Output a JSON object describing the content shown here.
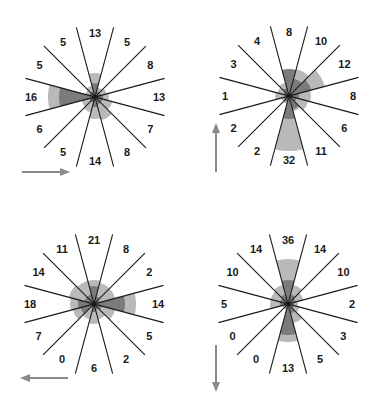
{
  "colors": {
    "background": "#ffffff",
    "line": "#1a1a1a",
    "wedge_light": "#b9b9b9",
    "wedge_dark": "#7b7b7b",
    "arrow": "#8a8a8a",
    "label": "#1a1a1a"
  },
  "layout": {
    "line_half_length": 72,
    "label_radius": 64,
    "sector_angles_deg": [
      0,
      30,
      60,
      90,
      120,
      150,
      180,
      210,
      240,
      270,
      300,
      330
    ],
    "boundary_angles_deg": [
      15,
      45,
      75,
      105,
      135,
      165
    ]
  },
  "panels": [
    {
      "id": "panel-1",
      "center": [
        95,
        97
      ],
      "direction": "right",
      "arrow": {
        "x1": 22,
        "y1": 172,
        "x2": 70,
        "y2": 172
      },
      "labels": [
        "13",
        "5",
        "8",
        "13",
        "7",
        "8",
        "14",
        "5",
        "6",
        "16",
        "5",
        "5"
      ],
      "light_radii": [
        24,
        10,
        12,
        14,
        18,
        24,
        22,
        16,
        14,
        47,
        10,
        12
      ],
      "dark_radii": [
        14,
        6,
        6,
        8,
        8,
        8,
        10,
        6,
        6,
        36,
        6,
        6
      ]
    },
    {
      "id": "panel-2",
      "center": [
        289,
        96
      ],
      "direction": "up",
      "arrow": {
        "x1": 216,
        "y1": 172,
        "x2": 216,
        "y2": 123
      },
      "labels": [
        "8",
        "10",
        "12",
        "8",
        "6",
        "11",
        "32",
        "2",
        "2",
        "1",
        "3",
        "4"
      ],
      "light_radii": [
        26,
        28,
        37,
        22,
        20,
        16,
        55,
        8,
        8,
        14,
        12,
        14
      ],
      "dark_radii": [
        27,
        18,
        23,
        10,
        8,
        14,
        23,
        6,
        6,
        4,
        6,
        8
      ]
    },
    {
      "id": "panel-3",
      "center": [
        94,
        304
      ],
      "direction": "left",
      "arrow": {
        "x1": 68,
        "y1": 378,
        "x2": 20,
        "y2": 378
      },
      "labels": [
        "21",
        "8",
        "2",
        "14",
        "5",
        "2",
        "6",
        "0",
        "7",
        "18",
        "14",
        "11"
      ],
      "light_radii": [
        24,
        22,
        22,
        42,
        22,
        16,
        20,
        16,
        22,
        24,
        26,
        24
      ],
      "dark_radii": [
        18,
        8,
        6,
        31,
        8,
        6,
        8,
        4,
        14,
        16,
        10,
        10
      ]
    },
    {
      "id": "panel-4",
      "center": [
        288,
        304
      ],
      "direction": "down",
      "arrow": {
        "x1": 216,
        "y1": 345,
        "x2": 216,
        "y2": 392
      },
      "labels": [
        "36",
        "14",
        "10",
        "2",
        "3",
        "5",
        "13",
        "0",
        "0",
        "5",
        "10",
        "14"
      ],
      "light_radii": [
        45,
        20,
        16,
        10,
        12,
        20,
        38,
        6,
        6,
        18,
        18,
        20
      ],
      "dark_radii": [
        24,
        10,
        8,
        6,
        6,
        10,
        31,
        4,
        4,
        8,
        8,
        10
      ]
    }
  ]
}
